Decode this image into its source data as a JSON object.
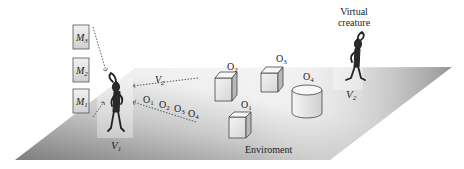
{
  "diagram": {
    "memory_boxes": [
      {
        "label": "M",
        "sub": "3"
      },
      {
        "label": "M",
        "sub": "2"
      },
      {
        "label": "M",
        "sub": "1"
      }
    ],
    "creatures": [
      {
        "label": "V",
        "sub": "1"
      },
      {
        "label": "V",
        "sub": "2",
        "caption_line1": "Virtual",
        "caption_line2": "creature"
      }
    ],
    "perception_labels": {
      "v2": {
        "label": "V",
        "sub": "2"
      },
      "objects": [
        {
          "label": "O",
          "sub": "1"
        },
        {
          "label": "O",
          "sub": "2"
        },
        {
          "label": "O",
          "sub": "3"
        },
        {
          "label": "O",
          "sub": "4"
        }
      ]
    },
    "objects": [
      {
        "label": "O",
        "sub": "2",
        "shape": "cube"
      },
      {
        "label": "O",
        "sub": "3",
        "shape": "cube"
      },
      {
        "label": "O",
        "sub": "1",
        "shape": "cube"
      },
      {
        "label": "O",
        "sub": "4",
        "shape": "cylinder"
      }
    ],
    "environment_label": "Enviroment",
    "colors": {
      "floor_dark": "#8a8a8a",
      "floor_light": "#f4f4f4",
      "stroke": "#333333"
    }
  }
}
